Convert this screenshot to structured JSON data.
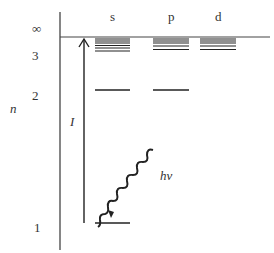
{
  "diagram": {
    "y_axis_label": "n",
    "level_labels": [
      "∞",
      "3",
      "2",
      "1"
    ],
    "column_labels": [
      "s",
      "p",
      "d"
    ],
    "ionization_label": "I",
    "photon_label": "hv",
    "colors": {
      "ink": "#222222",
      "background": "#ffffff"
    }
  }
}
